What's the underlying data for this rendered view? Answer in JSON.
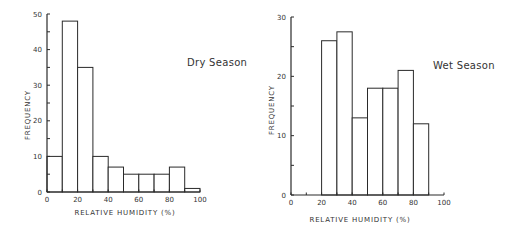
{
  "chart_data": [
    {
      "type": "bar",
      "title": "Dry Season",
      "xlabel": "RELATIVE HUMIDITY (%)",
      "ylabel": "FREQUENCY",
      "categories": [
        "0-10",
        "10-20",
        "20-30",
        "30-40",
        "40-50",
        "50-60",
        "60-70",
        "70-80",
        "80-90",
        "90-100"
      ],
      "bin_edges": [
        0,
        10,
        20,
        30,
        40,
        50,
        60,
        70,
        80,
        90,
        100
      ],
      "values": [
        10,
        48,
        35,
        10,
        7,
        5,
        5,
        5,
        7,
        1
      ],
      "xlim": [
        0,
        100
      ],
      "ylim": [
        0,
        50
      ],
      "xticks": [
        0,
        20,
        40,
        60,
        80,
        100
      ],
      "yticks": [
        0,
        10,
        20,
        30,
        40,
        50
      ],
      "grid": false,
      "legend": null,
      "annotation": "Dry Season"
    },
    {
      "type": "bar",
      "title": "Wet Season",
      "xlabel": "RELATIVE HUMIDITY (%)",
      "ylabel": "FREQUENCY",
      "categories": [
        "0-10",
        "10-20",
        "20-30",
        "30-40",
        "40-50",
        "50-60",
        "60-70",
        "70-80",
        "80-90",
        "90-100"
      ],
      "bin_edges": [
        0,
        10,
        20,
        30,
        40,
        50,
        60,
        70,
        80,
        90,
        100
      ],
      "values": [
        0,
        0,
        26,
        27.5,
        13,
        18,
        18,
        21,
        12,
        0
      ],
      "xlim": [
        0,
        100
      ],
      "ylim": [
        0,
        30
      ],
      "xticks": [
        0,
        20,
        40,
        60,
        80,
        100
      ],
      "yticks": [
        0,
        10,
        20,
        30
      ],
      "grid": false,
      "legend": null,
      "annotation": "Wet Season"
    }
  ],
  "panels": {
    "dry": {
      "annotation": "Dry Season",
      "xlabel": "RELATIVE HUMIDITY (%)",
      "ylabel": "FREQUENCY",
      "xtick_labels": [
        "0",
        "20",
        "40",
        "60",
        "80",
        "100"
      ],
      "ytick_labels": [
        "0",
        "10",
        "20",
        "30",
        "40",
        "50"
      ]
    },
    "wet": {
      "annotation": "Wet Season",
      "xlabel": "RELATIVE HUMIDITY (%)",
      "ylabel": "FREQUENCY",
      "xtick_labels": [
        "0",
        "20",
        "40",
        "60",
        "80",
        "100"
      ],
      "ytick_labels": [
        "0",
        "10",
        "20",
        "30"
      ]
    }
  },
  "colors": {
    "line": "#2a2a2a",
    "bar_fill": "#ffffff"
  }
}
